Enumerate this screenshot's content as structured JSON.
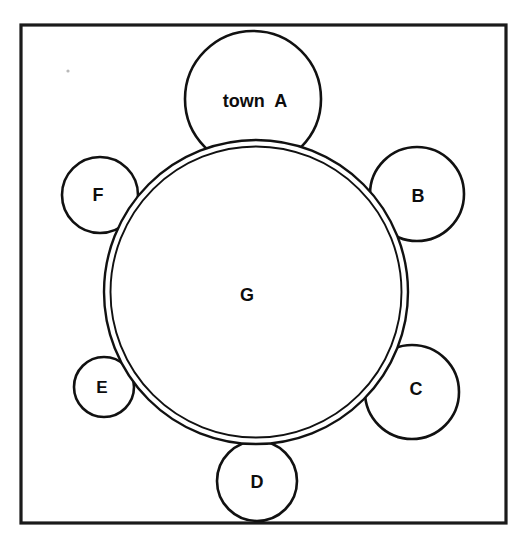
{
  "figure": {
    "name": "town-ring-diagram",
    "background_color": "#ffffff",
    "ink_color": "#111111",
    "frame": {
      "name": "outer-frame",
      "x": 21,
      "y": 25,
      "width": 485,
      "height": 498,
      "stroke_color": "#1a1a1a",
      "stroke_width": 3.2
    }
  },
  "chart_data": {
    "type": "diagram",
    "title": "",
    "subtitle": "",
    "center_region": {
      "id": "G",
      "label": "G",
      "cx": 256,
      "cy": 292,
      "outer_radius": 152,
      "inner_radius": 145.5,
      "stroke_width": 2.4,
      "label_x": 247,
      "label_y": 296,
      "label_font_size": 18
    },
    "satellites": [
      {
        "id": "A",
        "label": "town  A",
        "cx": 253,
        "cy": 99,
        "radius": 68,
        "angle_deg": 269,
        "stroke_width": 2.6,
        "label_x": 255,
        "label_y": 102,
        "label_font_size": 18,
        "size_rank": 1
      },
      {
        "id": "B",
        "label": "B",
        "cx": 417,
        "cy": 194,
        "radius": 47,
        "angle_deg": 327,
        "stroke_width": 2.6,
        "label_x": 418,
        "label_y": 197,
        "label_font_size": 18,
        "size_rank": 2
      },
      {
        "id": "C",
        "label": "C",
        "cx": 412,
        "cy": 392,
        "radius": 47,
        "angle_deg": 35,
        "stroke_width": 2.6,
        "label_x": 416,
        "label_y": 390,
        "label_font_size": 18,
        "size_rank": 3
      },
      {
        "id": "D",
        "label": "D",
        "cx": 257,
        "cy": 481,
        "radius": 40,
        "angle_deg": 88,
        "stroke_width": 2.6,
        "label_x": 257,
        "label_y": 483,
        "label_font_size": 18,
        "size_rank": 4
      },
      {
        "id": "E",
        "label": "E",
        "cx": 104,
        "cy": 387,
        "radius": 30,
        "angle_deg": 148,
        "stroke_width": 2.6,
        "label_x": 102,
        "label_y": 389,
        "label_font_size": 17,
        "size_rank": 6
      },
      {
        "id": "F",
        "label": "F",
        "cx": 100,
        "cy": 195,
        "radius": 38,
        "angle_deg": 212,
        "stroke_width": 2.6,
        "label_x": 98,
        "label_y": 196,
        "label_font_size": 18,
        "size_rank": 5
      }
    ],
    "legend": [],
    "annotations": [
      {
        "id": "speck",
        "kind": "scan-artifact",
        "cx": 68,
        "cy": 71,
        "r": 1.6
      }
    ]
  }
}
